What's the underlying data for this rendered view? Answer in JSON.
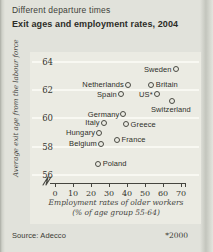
{
  "card": {
    "title": "Different departure times",
    "subtitle": "Exit ages and employment rates, 2004",
    "source": "Source: Adecco",
    "footnote": "*2000"
  },
  "chart_data": {
    "type": "scatter",
    "title": "Different departure times",
    "subtitle": "Exit ages and employment rates, 2004",
    "xlabel": "Employment rates of older workers",
    "xlabel2": "(% of age group 55-64)",
    "ylabel": "Average exit age from the labour force",
    "x_ticks": [
      0,
      10,
      20,
      30,
      40,
      50,
      60,
      70
    ],
    "y_ticks": [
      64,
      62,
      60,
      58,
      56
    ],
    "xlim": [
      0,
      70
    ],
    "ylim": [
      56,
      64
    ],
    "axis_break": true,
    "grid": "horizontal white gridlines, no legend",
    "marker_style": "open circle",
    "points": [
      {
        "country": "Sweden",
        "employment_rate": 67,
        "exit_age": 63.5,
        "label_side": "left"
      },
      {
        "country": "Netherlands",
        "employment_rate": 40.5,
        "exit_age": 62.4,
        "label_side": "left"
      },
      {
        "country": "Britain",
        "employment_rate": 53.5,
        "exit_age": 62.4,
        "label_side": "right"
      },
      {
        "country": "Spain",
        "employment_rate": 36.5,
        "exit_age": 61.7,
        "label_side": "left"
      },
      {
        "country": "US*",
        "employment_rate": 56.5,
        "exit_age": 61.7,
        "label_side": "left"
      },
      {
        "country": "Switzerland",
        "employment_rate": 65,
        "exit_age": 61.2,
        "label_side": "below"
      },
      {
        "country": "Germany",
        "employment_rate": 38,
        "exit_age": 60.3,
        "label_side": "left"
      },
      {
        "country": "Italy",
        "employment_rate": 27,
        "exit_age": 59.7,
        "label_side": "left"
      },
      {
        "country": "Greece",
        "employment_rate": 39.5,
        "exit_age": 59.6,
        "label_side": "right"
      },
      {
        "country": "Hungary",
        "employment_rate": 24.5,
        "exit_age": 59.0,
        "label_side": "left"
      },
      {
        "country": "France",
        "employment_rate": 34.5,
        "exit_age": 58.5,
        "label_side": "right"
      },
      {
        "country": "Belgium",
        "employment_rate": 25.5,
        "exit_age": 58.2,
        "label_side": "left"
      },
      {
        "country": "Poland",
        "employment_rate": 24,
        "exit_age": 56.8,
        "label_side": "right"
      }
    ],
    "source": "Source: Adecco",
    "footnote": "*2000"
  },
  "colors": {
    "card_bg": "#e1e2db",
    "panel_bg": "#ebebe3",
    "gridline": "#f8f8f2",
    "axis": "#45453f",
    "text": "#2f2f2a"
  }
}
